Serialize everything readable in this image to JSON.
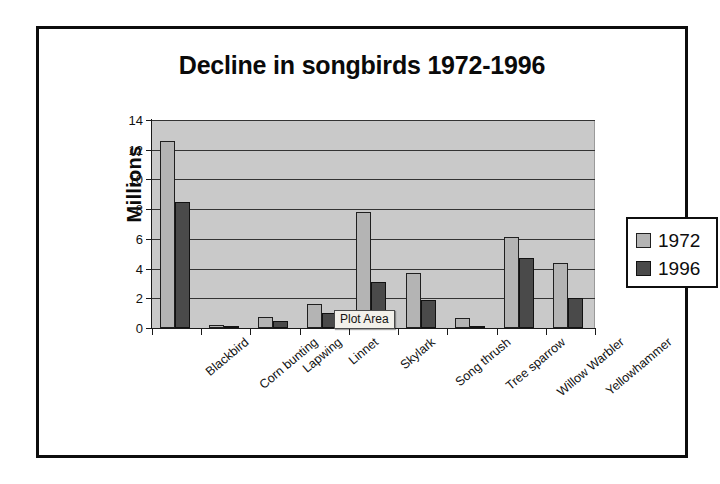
{
  "chart_data": {
    "type": "bar",
    "title": "Decline in songbirds 1972-1996",
    "xlabel": "",
    "ylabel": "Millions",
    "ylim": [
      0,
      14
    ],
    "yticks": [
      0,
      2,
      4,
      6,
      8,
      10,
      12,
      14
    ],
    "grid": true,
    "legend_position": "right",
    "categories": [
      "Blackbird",
      "Corn bunting",
      "Lapwing",
      "Linnet",
      "Skylark",
      "Song thrush",
      "Tree sparrow",
      "Willow Warbler",
      "Yellowhammer"
    ],
    "series": [
      {
        "name": "1972",
        "color": "#b4b4b4",
        "values": [
          12.6,
          0.2,
          0.75,
          1.6,
          7.8,
          3.7,
          0.7,
          6.1,
          4.4
        ]
      },
      {
        "name": "1996",
        "color": "#4a4a4a",
        "values": [
          8.5,
          0.05,
          0.45,
          1.0,
          3.1,
          1.9,
          0.1,
          4.7,
          2.0
        ]
      }
    ]
  },
  "annotations": {
    "plot_area_tooltip": "Plot Area"
  },
  "colors": {
    "plot_background": "#c9c9c9",
    "gridline": "#333333",
    "frame_border": "#0d0d0d",
    "series_1972": "#b4b4b4",
    "series_1996": "#4a4a4a"
  }
}
